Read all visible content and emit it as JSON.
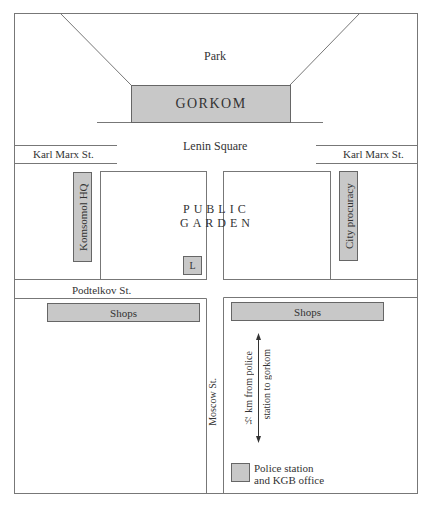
{
  "map": {
    "areas": {
      "park": "Park",
      "lenin_square": "Lenin Square",
      "public_garden_line1": "PUBLIC",
      "public_garden_line2": "GARDEN"
    },
    "buildings": {
      "gorkom": "GORKOM",
      "komsomol_hq": "Komsomol HQ",
      "city_procuracy": "City procuracy",
      "lenin_statue": "L",
      "shops_left": "Shops",
      "shops_right": "Shops"
    },
    "streets": {
      "karl_marx_left": "Karl Marx  St.",
      "karl_marx_right": "Karl Marx  St.",
      "podtelkov": "Podtelkov  St.",
      "moscow": "Moscow  St."
    },
    "annotations": {
      "distance_line1": "½ km from police",
      "distance_line2": "station to gorkom"
    },
    "legend": {
      "police_line1": "Police station",
      "police_line2": "and KGB office"
    },
    "colors": {
      "building_fill": "#c8c8c8",
      "line": "#666666"
    }
  }
}
